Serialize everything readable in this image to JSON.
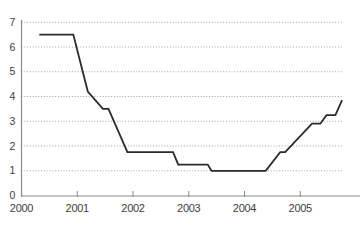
{
  "chart_data": {
    "type": "line",
    "title": "",
    "xlabel": "",
    "ylabel": "",
    "xlim": [
      2000,
      2006.08
    ],
    "ylim": [
      0,
      7
    ],
    "x_ticks": [
      2000,
      2001,
      2002,
      2003,
      2004,
      2005
    ],
    "x_tick_labels": [
      "2000",
      "2001",
      "2002",
      "2003",
      "2004",
      "2005"
    ],
    "y_ticks": [
      0,
      1,
      2,
      3,
      4,
      5,
      6,
      7
    ],
    "y_tick_labels": [
      "0",
      "1",
      "2",
      "3",
      "4",
      "5",
      "6",
      "7"
    ],
    "grid": "horizontal-dotted",
    "legend_position": "none",
    "series": [
      {
        "name": "interest-rate",
        "color": "#2b2b2b",
        "points": [
          [
            2000.32,
            6.5
          ],
          [
            2000.93,
            6.5
          ],
          [
            2001.19,
            4.2
          ],
          [
            2001.46,
            3.5
          ],
          [
            2001.56,
            3.5
          ],
          [
            2001.9,
            1.75
          ],
          [
            2002.72,
            1.75
          ],
          [
            2002.81,
            1.25
          ],
          [
            2003.34,
            1.25
          ],
          [
            2003.41,
            1.0
          ],
          [
            2004.38,
            1.0
          ],
          [
            2004.64,
            1.75
          ],
          [
            2004.73,
            1.75
          ],
          [
            2005.21,
            2.9
          ],
          [
            2005.36,
            2.9
          ],
          [
            2005.47,
            3.25
          ],
          [
            2005.63,
            3.25
          ],
          [
            2005.75,
            3.85
          ]
        ]
      }
    ]
  },
  "style": {
    "background": "#ffffff",
    "line_color": "#2b2b2b",
    "grid_color": "#a3a3a3",
    "axis_color": "#8a8a8a",
    "label_color": "#3d3d3d",
    "line_width": 1.8,
    "y_label_font_size": 10.5,
    "x_label_font_size": 11
  },
  "layout": {
    "width": 363,
    "height": 230,
    "plot_left": 21.5,
    "plot_bottom": 196,
    "axis_top": 20,
    "axis_right_end": 360,
    "grid_right_end": 342,
    "px_per_year": 55.75,
    "px_per_unit": 24.75,
    "x_label_y": 212,
    "y_label_x": 15,
    "tick_len": 5
  }
}
